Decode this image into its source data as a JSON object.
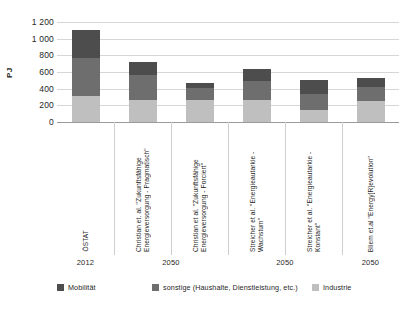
{
  "chart_data": {
    "type": "bar",
    "stacked": true,
    "title": "",
    "xlabel": "",
    "ylabel": "PJ",
    "ylim": [
      0,
      1200
    ],
    "yticks": [
      "0",
      "200",
      "400",
      "600",
      "800",
      "1 000",
      "1 200"
    ],
    "ytick_values": [
      0,
      200,
      400,
      600,
      800,
      1000,
      1200
    ],
    "grid": true,
    "legend_position": "bottom",
    "categories": [
      "ÖSTAT",
      "Christian et. al. \"Zukunftsfähige Energieversorgung - Pragmatisch\"",
      "Christian et al. \"Zukunftsfähige Energieversorgung - Forciert\"",
      "Streicher et al. \"Energieautarkie - Wachstum\"",
      "Streicher et al. \"Energieautarkie - Konstant\"",
      "Bliem et.al \"Energy[R]evolution\""
    ],
    "group_labels": [
      {
        "label": "2012",
        "span": [
          0,
          0
        ]
      },
      {
        "label": "2050",
        "span": [
          1,
          2
        ]
      },
      {
        "label": "2050",
        "span": [
          3,
          4
        ]
      },
      {
        "label": "2050",
        "span": [
          5,
          5
        ]
      }
    ],
    "series": [
      {
        "name": "Industrie",
        "color": "#bfbfbf",
        "values": [
          310,
          265,
          260,
          265,
          150,
          255
        ]
      },
      {
        "name": "sonstige (Haushalte, Dienstleistung, etc.)",
        "color": "#6e6e6e",
        "values": [
          460,
          295,
          145,
          230,
          190,
          165
        ]
      },
      {
        "name": "Mobilität",
        "color": "#4d4d4d",
        "values": [
          330,
          155,
          65,
          145,
          160,
          110
        ]
      }
    ],
    "totals": [
      1100,
      715,
      470,
      640,
      500,
      530
    ]
  },
  "legend": {
    "items": [
      {
        "label": "Mobilität",
        "color": "#4d4d4d"
      },
      {
        "label": "sonstige (Haushalte, Dienstleistung, etc.)",
        "color": "#6e6e6e"
      },
      {
        "label": "Industrie",
        "color": "#bfbfbf"
      }
    ]
  }
}
